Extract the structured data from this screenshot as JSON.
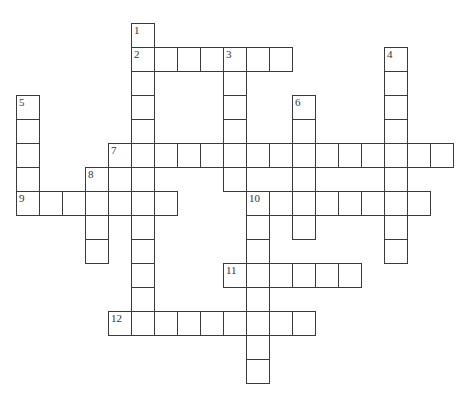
{
  "puzzle": {
    "grid_origin": {
      "x": 16,
      "y": 23
    },
    "cell_size": {
      "w": 23,
      "h": 24
    },
    "line_color": "#3a3a3a",
    "entries": [
      {
        "number": 1,
        "direction": "down",
        "row": 0,
        "col": 5,
        "length": 13
      },
      {
        "number": 2,
        "direction": "across",
        "row": 1,
        "col": 5,
        "length": 7
      },
      {
        "number": 3,
        "direction": "down",
        "row": 1,
        "col": 9,
        "length": 6
      },
      {
        "number": 4,
        "direction": "down",
        "row": 1,
        "col": 16,
        "length": 9
      },
      {
        "number": 5,
        "direction": "down",
        "row": 3,
        "col": 0,
        "length": 5
      },
      {
        "number": 6,
        "direction": "down",
        "row": 3,
        "col": 12,
        "length": 6
      },
      {
        "number": 7,
        "direction": "across",
        "row": 5,
        "col": 4,
        "length": 15
      },
      {
        "number": 8,
        "direction": "down",
        "row": 6,
        "col": 3,
        "length": 4
      },
      {
        "number": 9,
        "direction": "across",
        "row": 7,
        "col": 0,
        "length": 7
      },
      {
        "number": 10,
        "direction": "across",
        "row": 7,
        "col": 10,
        "length": 8
      },
      {
        "number": 10,
        "direction": "down",
        "row": 7,
        "col": 10,
        "length": 8
      },
      {
        "number": 11,
        "direction": "across",
        "row": 10,
        "col": 9,
        "length": 6
      },
      {
        "number": 12,
        "direction": "across",
        "row": 12,
        "col": 4,
        "length": 9
      }
    ]
  }
}
